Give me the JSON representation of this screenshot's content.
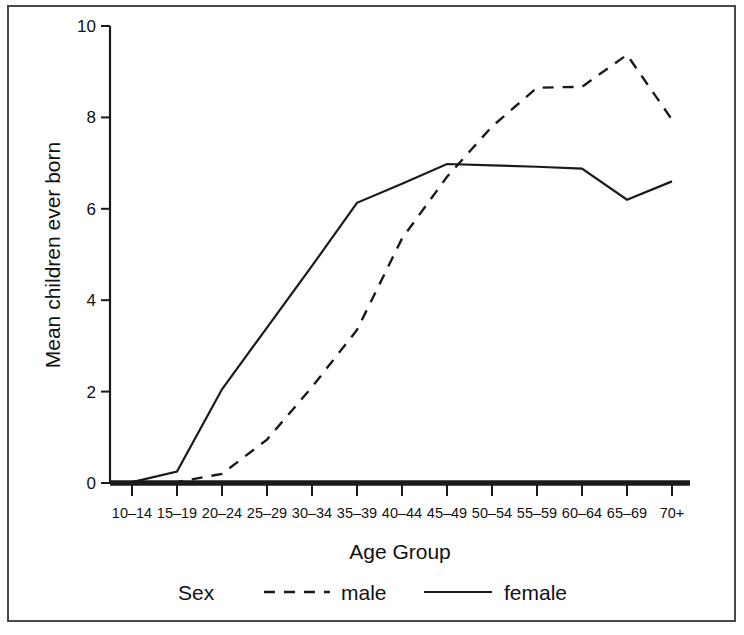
{
  "figure": {
    "border_color": "#444a4d",
    "background": "#ffffff"
  },
  "axes": {
    "ylabel": "Mean children ever born",
    "xlabel": "Age Group",
    "yticks": [
      "0",
      "2",
      "4",
      "6",
      "8",
      "10"
    ],
    "xticks": [
      "10–14",
      "15–19",
      "20–24",
      "25–29",
      "30–34",
      "35–39",
      "40–44",
      "45–49",
      "50–54",
      "55–59",
      "60–64",
      "65–69",
      "70+"
    ]
  },
  "legend": {
    "title": "Sex",
    "entries": [
      {
        "label": "male",
        "style": "dashed"
      },
      {
        "label": "female",
        "style": "solid"
      }
    ]
  },
  "chart_data": {
    "type": "line",
    "title": "",
    "xlabel": "Age Group",
    "ylabel": "Mean children ever born",
    "categories": [
      "10–14",
      "15–19",
      "20–24",
      "25–29",
      "30–34",
      "35–39",
      "40–44",
      "45–49",
      "50–54",
      "55–59",
      "60–64",
      "65–69",
      "70+"
    ],
    "ylim": [
      0,
      10
    ],
    "yticks": [
      0,
      2,
      4,
      6,
      8,
      10
    ],
    "grid": false,
    "legend_position": "bottom",
    "series": [
      {
        "name": "female",
        "style": "solid",
        "color": "#1a1a1a",
        "values": [
          0.02,
          0.25,
          2.05,
          3.4,
          4.75,
          6.13,
          6.55,
          6.98,
          6.95,
          6.92,
          6.88,
          6.2,
          6.6
        ]
      },
      {
        "name": "male",
        "style": "dashed",
        "color": "#1a1a1a",
        "values": [
          0.0,
          0.02,
          0.2,
          0.95,
          2.1,
          3.35,
          5.35,
          6.7,
          7.8,
          8.65,
          8.67,
          9.37,
          7.95
        ]
      }
    ]
  }
}
